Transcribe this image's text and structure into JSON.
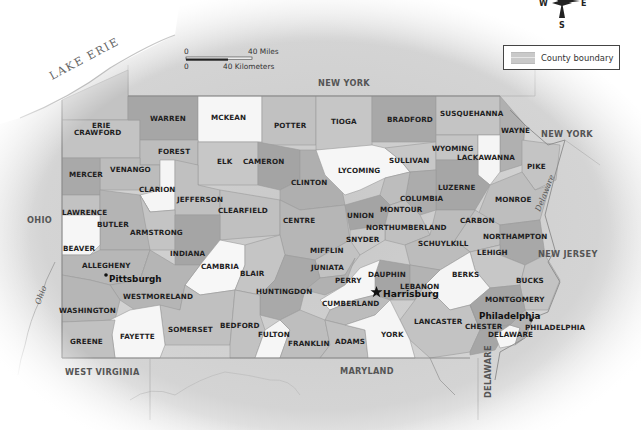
{
  "map": {
    "title": "Pennsylvania Counties",
    "compass": {
      "west": "W",
      "east": "E",
      "south": "S"
    },
    "legend": {
      "items": [
        {
          "label": "County boundary",
          "swatch_color": "#c9c9c9"
        }
      ]
    },
    "scale_bar": {
      "miles_start": "0",
      "miles_end": "40 Miles",
      "km_start": "0",
      "km_end": "40 Kilometers"
    },
    "water_bodies": {
      "lake": "LAKE ERIE",
      "river_ohio": "Ohio",
      "river_delaware": "Delaware"
    },
    "neighbors": {
      "ny_north": "NEW YORK",
      "ny_east": "NEW YORK",
      "ohio": "OHIO",
      "new_jersey": "NEW JERSEY",
      "west_virginia": "WEST VIRGINIA",
      "maryland": "MARYLAND",
      "delaware": "DELAWARE"
    },
    "cities": {
      "capital": "Harrisburg",
      "pittsburgh": "Pittsburgh",
      "philadelphia": "Philadelphia"
    },
    "colors": {
      "white": "#f7f7f7",
      "light": "#c8c8c8",
      "mid": "#b3b3b3",
      "dark": "#9c9c9c",
      "darker": "#8e8e8e"
    },
    "counties": [
      "ERIE",
      "CRAWFORD",
      "WARREN",
      "MCKEAN",
      "POTTER",
      "TIOGA",
      "BRADFORD",
      "SUSQUEHANNA",
      "WAYNE",
      "FOREST",
      "ELK",
      "CAMERON",
      "VENANGO",
      "MERCER",
      "CLARION",
      "JEFFERSON",
      "CLINTON",
      "LYCOMING",
      "SULLIVAN",
      "WYOMING",
      "LACKAWANNA",
      "PIKE",
      "LUZERNE",
      "COLUMBIA",
      "MONTOUR",
      "MONROE",
      "LAWRENCE",
      "BUTLER",
      "CLEARFIELD",
      "CENTRE",
      "UNION",
      "NORTHUMBERLAND",
      "CARBON",
      "ARMSTRONG",
      "SNYDER",
      "SCHUYLKILL",
      "NORTHAMPTON",
      "BEAVER",
      "INDIANA",
      "MIFFLIN",
      "LEHIGH",
      "ALLEGHENY",
      "CAMBRIA",
      "BLAIR",
      "JUNIATA",
      "DAUPHIN",
      "BERKS",
      "PERRY",
      "LEBANON",
      "WESTMORELAND",
      "HUNTINGDON",
      "BUCKS",
      "CUMBERLAND",
      "WASHINGTON",
      "MONTGOMERY",
      "SOMERSET",
      "BEDFORD",
      "LANCASTER",
      "CHESTER",
      "FAYETTE",
      "FULTON",
      "FRANKLIN",
      "ADAMS",
      "YORK",
      "DELAWARE",
      "PHILADELPHIA",
      "GREENE"
    ]
  }
}
